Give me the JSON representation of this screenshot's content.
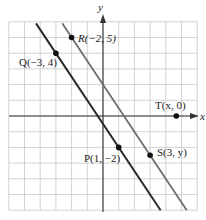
{
  "chart_data": {
    "type": "line",
    "title": "",
    "xlabel": "x",
    "ylabel": "y",
    "xlim": [
      -6,
      6
    ],
    "ylim": [
      -6,
      6
    ],
    "grid": true,
    "legend": null,
    "series": [
      {
        "name": "Line through Q and P",
        "color": "#2a2a2a",
        "points": [
          {
            "x": -3,
            "y": 4
          },
          {
            "x": 1,
            "y": -2
          }
        ],
        "slope": -1.5
      },
      {
        "name": "Line through R, T and S",
        "color": "#6e6e6e",
        "points": [
          {
            "x": -2,
            "y": 5
          },
          {
            "x": 4.67,
            "y": 0
          },
          {
            "x": 3,
            "y": -2.5
          }
        ],
        "slope": -1.5
      }
    ],
    "annotations": [
      {
        "id": "R",
        "label": "R(−2, 5)",
        "x": -2,
        "y": 5
      },
      {
        "id": "Q",
        "label": "Q(−3, 4)",
        "x": -3,
        "y": 4
      },
      {
        "id": "T",
        "label": "T(x, 0)",
        "x": 4.67,
        "y": 0
      },
      {
        "id": "P",
        "label": "P(1, −2)",
        "x": 1,
        "y": -2
      },
      {
        "id": "S",
        "label": "S(3, y)",
        "x": 3,
        "y": -2.5
      }
    ]
  },
  "axes": {
    "x_label": "x",
    "y_label": "y"
  },
  "labels": {
    "R": "R(−2, 5)",
    "Q": "Q(−3, 4)",
    "T": "T(x, 0)",
    "P": "P(1, −2)",
    "S": "S(3, y)"
  }
}
